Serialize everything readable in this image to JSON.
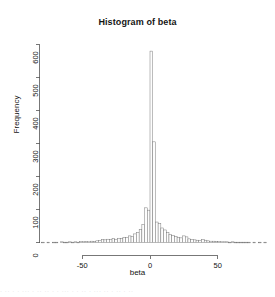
{
  "chart_data": {
    "type": "bar",
    "title": "Histogram of beta",
    "xlabel": "beta",
    "ylabel": "Frequency",
    "grid": false,
    "legend": null,
    "xlim": [
      -80,
      86
    ],
    "ylim": [
      0,
      620
    ],
    "xticks": [
      -50,
      0,
      50
    ],
    "xtick_labels": [
      "-50",
      "0",
      "50"
    ],
    "yticks": [
      0,
      100,
      200,
      300,
      400,
      500,
      600
    ],
    "ytick_labels": [
      "0",
      "100",
      "200",
      "300",
      "400",
      "500",
      "600"
    ],
    "bin_width": 2,
    "bin_starts": [
      -80,
      -78,
      -76,
      -74,
      -72,
      -70,
      -68,
      -66,
      -64,
      -62,
      -60,
      -58,
      -56,
      -54,
      -52,
      -50,
      -48,
      -46,
      -44,
      -42,
      -40,
      -38,
      -36,
      -34,
      -32,
      -30,
      -28,
      -26,
      -24,
      -22,
      -20,
      -18,
      -16,
      -14,
      -12,
      -10,
      -8,
      -6,
      -4,
      -2,
      0,
      2,
      4,
      6,
      8,
      10,
      12,
      14,
      16,
      18,
      20,
      22,
      24,
      26,
      28,
      30,
      32,
      34,
      36,
      38,
      40,
      42,
      44,
      46,
      48,
      50,
      52,
      54,
      56,
      58,
      60,
      62,
      64,
      66,
      68,
      70,
      72,
      74,
      76,
      78,
      80,
      82,
      84
    ],
    "values": [
      1,
      0,
      1,
      0,
      1,
      1,
      0,
      2,
      1,
      1,
      2,
      1,
      2,
      1,
      3,
      2,
      3,
      2,
      4,
      3,
      5,
      6,
      9,
      8,
      10,
      9,
      12,
      10,
      13,
      12,
      16,
      15,
      20,
      19,
      26,
      31,
      40,
      55,
      105,
      98,
      580,
      305,
      62,
      58,
      44,
      38,
      30,
      25,
      21,
      18,
      16,
      14,
      20,
      17,
      11,
      9,
      8,
      7,
      6,
      9,
      7,
      5,
      4,
      4,
      3,
      3,
      2,
      2,
      2,
      1,
      2,
      1,
      1,
      1,
      1,
      1,
      1,
      0,
      1,
      0,
      1,
      0,
      1
    ],
    "peak": {
      "bin_start": 0,
      "value": 580
    },
    "second_peak": {
      "bin_start": 2,
      "value": 305
    }
  },
  "footer": {
    "smudge": "· ·· · · ··· · ·· ·· · · ··· · · ·· · ··· ·· · ·· · ··"
  }
}
